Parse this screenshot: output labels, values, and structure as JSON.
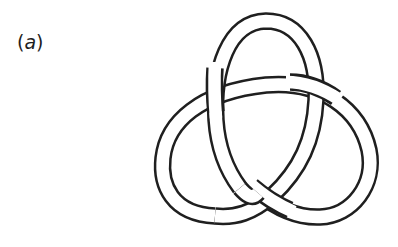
{
  "figure": {
    "panel_label": {
      "open": "(",
      "letter": "a",
      "close": ")"
    },
    "style": {
      "line_color": "#1f1f1f",
      "fill_color": "#ffffff",
      "background": "#ffffff"
    },
    "crossings": 3
  }
}
